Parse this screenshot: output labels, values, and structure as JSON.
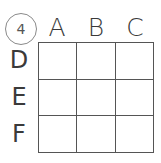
{
  "puzzle": {
    "number": "4",
    "columns": [
      {
        "label": "A"
      },
      {
        "label": "B"
      },
      {
        "label": "C"
      }
    ],
    "rows": [
      {
        "label": "D",
        "cells": [
          "",
          "",
          ""
        ]
      },
      {
        "label": "E",
        "cells": [
          "",
          "",
          ""
        ]
      },
      {
        "label": "F",
        "cells": [
          "",
          "",
          ""
        ]
      }
    ]
  },
  "colors": {
    "line": "#555555",
    "text": "#3a3a3a",
    "badge_border": "#8a8a8a",
    "background": "#ffffff"
  }
}
